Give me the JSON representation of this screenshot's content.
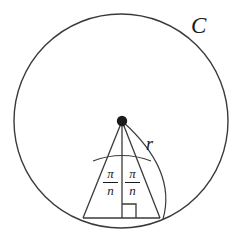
{
  "figure": {
    "kind": "geometry-diagram",
    "background_color": "#ffffff",
    "stroke_color": "#3a3a3a",
    "ink_color": "#1b1b1b",
    "labels": {
      "circle": "C",
      "radius": "r",
      "angle_numerator": "π",
      "angle_denominator": "n"
    },
    "geometry": {
      "canvas": {
        "width": 245,
        "height": 240
      },
      "circle": {
        "cx": 121,
        "cy": 121,
        "r": 107
      },
      "center_point": {
        "x": 122,
        "y": 121,
        "dot_radius": 5
      },
      "base_left": {
        "x": 83,
        "y": 218
      },
      "base_right": {
        "x": 160,
        "y": 218
      },
      "base_mid": {
        "x": 122,
        "y": 218
      },
      "angle_arc_y": 158,
      "right_angle_marker": {
        "x": 122,
        "y": 204,
        "size": 14
      }
    }
  }
}
